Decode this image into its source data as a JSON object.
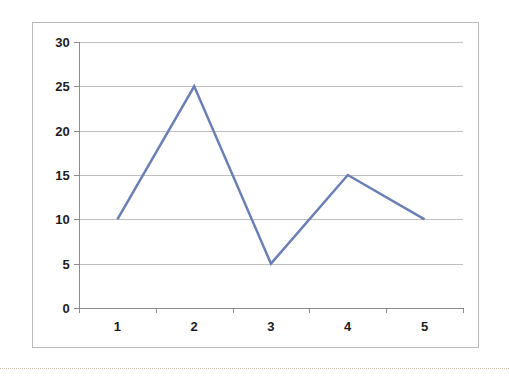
{
  "chart_data": {
    "type": "line",
    "title": "",
    "subtitle": "",
    "xlabel": "",
    "ylabel": "",
    "x": [
      1,
      2,
      3,
      4,
      5
    ],
    "categories": [
      "1",
      "2",
      "3",
      "4",
      "5"
    ],
    "values": [
      10,
      25,
      5,
      15,
      10
    ],
    "series": [
      {
        "name": "",
        "values": [
          10,
          25,
          5,
          15,
          10
        ]
      }
    ],
    "ylim": [
      0,
      30
    ],
    "ytick_labels": [
      "0",
      "5",
      "10",
      "15",
      "20",
      "25",
      "30"
    ],
    "yticks": [
      0,
      5,
      10,
      15,
      20,
      25,
      30
    ],
    "xtick_labels": [
      "1",
      "2",
      "3",
      "4",
      "5"
    ],
    "xticks": [
      1,
      2,
      3,
      4,
      5
    ],
    "grid": true,
    "grid_axis": "y",
    "legend": false,
    "legend_position": "none",
    "markers": false,
    "annotations": [],
    "colors": {
      "line": "#6b7fb5",
      "gridline": "#bfbfbf",
      "axis": "#8c8c8c",
      "border": "#b9b9b9",
      "label_text": "#1d1d1d",
      "background": "#ffffff",
      "bottom_rule": "#cdbfa0"
    },
    "line_width": 2.5
  }
}
